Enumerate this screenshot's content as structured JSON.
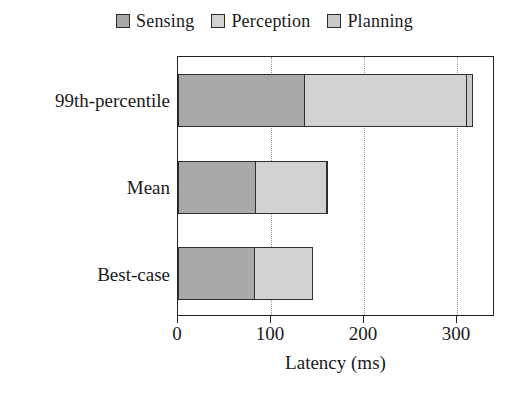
{
  "chart_data": {
    "type": "bar",
    "orientation": "horizontal",
    "stacked": true,
    "title": "",
    "xlabel": "Latency (ms)",
    "ylabel": "",
    "categories": [
      "Best-case",
      "Mean",
      "99th-percentile"
    ],
    "series": [
      {
        "name": "Sensing",
        "color": "#a9a9a9",
        "values": [
          83,
          84,
          137
        ]
      },
      {
        "name": "Perception",
        "color": "#d2d2d2",
        "values": [
          64,
          78,
          176
        ]
      },
      {
        "name": "Planning",
        "color": "#c9c9c9",
        "values": [
          0,
          2,
          7
        ]
      }
    ],
    "totals": [
      147,
      164,
      320
    ],
    "xlim": [
      0,
      341
    ],
    "xticks": [
      0,
      100,
      200,
      300
    ],
    "xtick_labels": [
      "0",
      "100",
      "200",
      "300"
    ],
    "grid": "vertical-dotted",
    "legend_position": "top-center",
    "frame": true
  },
  "legend": {
    "entries": [
      {
        "label": "Sensing",
        "swatch_color": "#a9a9a9",
        "icon": "legend-swatch-icon"
      },
      {
        "label": "Perception",
        "swatch_color": "#d2d2d2",
        "icon": "legend-swatch-icon"
      },
      {
        "label": "Planning",
        "swatch_color": "#c9c9c9",
        "icon": "legend-swatch-icon"
      }
    ]
  },
  "axes": {
    "x_title": "Latency (ms)",
    "x_tick_labels": [
      "0",
      "100",
      "200",
      "300"
    ],
    "y_tick_labels": [
      "99th-percentile",
      "Mean",
      "Best-case"
    ]
  },
  "colors": {
    "sensing": "#a9a9a9",
    "perception": "#d2d2d2",
    "planning": "#c9c9c9",
    "axis": "#222222",
    "grid": "#9a9a9a",
    "background": "#ffffff"
  }
}
